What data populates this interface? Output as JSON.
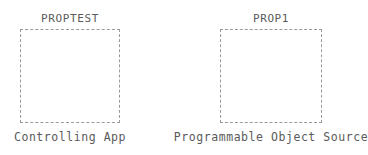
{
  "diagram": {
    "type": "two-node-block-diagram",
    "background_color": "#ffffff",
    "border_color": "#9a9a9a",
    "text_color": "#5a5a5a",
    "nodes": [
      {
        "id": "controlling-app",
        "title": "PROPTEST",
        "caption": "Controlling App"
      },
      {
        "id": "object-source",
        "title": "PROP1",
        "caption": "Programmable Object Source"
      }
    ]
  }
}
